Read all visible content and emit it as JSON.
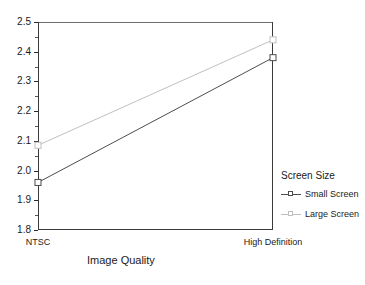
{
  "chart_data": {
    "type": "line",
    "title": "",
    "xlabel": "Image Quality",
    "ylabel": "",
    "categories": [
      "NTSC",
      "High Definition"
    ],
    "ylim": [
      1.8,
      2.5
    ],
    "ytick_step": 0.1,
    "yticks": [
      "1.8",
      "1.9",
      "2.0",
      "2.1",
      "2.2",
      "2.3",
      "2.4",
      "2.5"
    ],
    "minor_ticks": true,
    "grid": false,
    "legend_position": "right",
    "legend_title": "Screen Size",
    "series": [
      {
        "name": "Small Screen",
        "values": [
          1.96,
          2.38
        ],
        "color": "#4d4d4d",
        "marker": "square-open"
      },
      {
        "name": "Large Screen",
        "values": [
          2.085,
          2.44
        ],
        "color": "#c0c0c0",
        "marker": "square-open"
      }
    ]
  },
  "legend": {
    "title": "Screen Size",
    "entries": [
      {
        "label": "Small Screen",
        "color": "#4d4d4d"
      },
      {
        "label": "Large Screen",
        "color": "#c0c0c0"
      }
    ]
  },
  "axes": {
    "x_title": "Image Quality",
    "x_categories": [
      "NTSC",
      "High Definition"
    ],
    "y_tick_labels": [
      "2.5",
      "2.4",
      "2.3",
      "2.2",
      "2.1",
      "2.0",
      "1.9",
      "1.8"
    ]
  }
}
